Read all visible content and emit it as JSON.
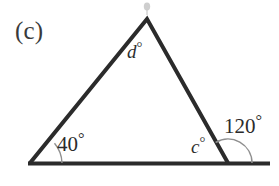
{
  "figure": {
    "part_label": "(c)",
    "background_color": "#ffffff",
    "stroke_color": "#2b2b2b",
    "arc_color": "#8a8a8a",
    "smudge_color": "#b9b9b9",
    "labels": {
      "apex_angle": "d",
      "apex_angle_degree_symbol": "°",
      "left_angle": "40",
      "left_angle_degree_symbol": "°",
      "right_interior_angle": "c",
      "right_interior_angle_degree_symbol": "°",
      "exterior_angle": "120",
      "exterior_angle_degree_symbol": "°"
    },
    "geometry": {
      "apex": [
        147,
        19
      ],
      "left_vertex": [
        30,
        163
      ],
      "right_vertex": [
        228,
        163
      ],
      "baseline_start": [
        28,
        163
      ],
      "baseline_end": [
        270,
        163
      ],
      "triangle_stroke_width": 4,
      "baseline_stroke_width": 4
    }
  }
}
